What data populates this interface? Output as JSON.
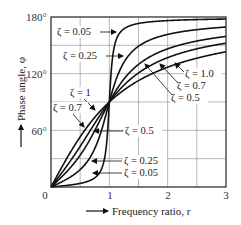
{
  "chart_data": {
    "type": "line",
    "title": "",
    "xlabel": "Frequency ratio, r",
    "ylabel": "Phase angle, φ",
    "xlim": [
      0,
      3
    ],
    "ylim": [
      0,
      180
    ],
    "x_ticks": [
      "0",
      "1",
      "2",
      "3"
    ],
    "y_ticks": [
      "60°",
      "120°",
      "180°"
    ],
    "grid": true,
    "grid_x_step": 0.5,
    "grid_y_step": 30,
    "formula": "phi = atan2(2*zeta*r, 1 - r^2)",
    "series": [
      {
        "name": "ζ = 0.05",
        "zeta": 0.05,
        "x": [
          0,
          0.5,
          0.9,
          1,
          1.1,
          1.5,
          2,
          3
        ],
        "values": [
          0,
          3.8,
          25.3,
          90,
          152.4,
          175.4,
          178.1,
          178.9
        ]
      },
      {
        "name": "ζ = 0.25",
        "zeta": 0.25,
        "x": [
          0,
          0.5,
          0.9,
          1,
          1.1,
          1.5,
          2,
          3
        ],
        "values": [
          0,
          18.4,
          67.0,
          90,
          110.5,
          148.0,
          161.6,
          169.4
        ]
      },
      {
        "name": "ζ = 0.5",
        "zeta": 0.5,
        "x": [
          0,
          0.5,
          0.9,
          1,
          1.1,
          1.5,
          2,
          3
        ],
        "values": [
          0,
          33.7,
          78.1,
          90,
          102.6,
          129.8,
          146.3,
          159.4
        ]
      },
      {
        "name": "ζ = 0.7",
        "zeta": 0.7,
        "x": [
          0,
          0.5,
          0.9,
          1,
          1.1,
          1.5,
          2,
          3
        ],
        "values": [
          0,
          43.0,
          81.5,
          90,
          97.7,
          120.3,
          136.8,
          152.3
        ]
      },
      {
        "name": "ζ = 1.0",
        "zeta": 1.0,
        "x": [
          0,
          0.5,
          0.9,
          1,
          1.1,
          1.5,
          2,
          3
        ],
        "values": [
          0,
          53.1,
          84.0,
          90,
          95.4,
          112.6,
          126.9,
          143.1
        ]
      }
    ],
    "annotations": [
      {
        "text": "ζ = 0.05",
        "pos": "upper-left, arrow to high branch"
      },
      {
        "text": "ζ = 0.25",
        "pos": "upper-left, arrow to high branch"
      },
      {
        "text": "ζ = 1.0",
        "pos": "right, arrow to high branch"
      },
      {
        "text": "ζ = 0.7",
        "pos": "right, arrow to high branch"
      },
      {
        "text": "ζ = 0.5",
        "pos": "right, arrow to high branch"
      },
      {
        "text": "ζ = 1",
        "pos": "left, arrow to low branch"
      },
      {
        "text": "ζ = 0.7",
        "pos": "left, arrow to low branch"
      },
      {
        "text": "ζ = 0.5",
        "pos": "center, arrow to low branch"
      },
      {
        "text": "ζ = 0.25",
        "pos": "lower center, arrow to low branch"
      },
      {
        "text": "ζ = 0.05",
        "pos": "lower center, arrow to low branch"
      }
    ]
  },
  "labels": {
    "y180": "180°",
    "y120": "120°",
    "y60": "60°",
    "x0": "0",
    "x1": "1",
    "x2": "2",
    "x3": "3",
    "xlabel": "Frequency ratio, r",
    "ylabel": "Phase angle, φ",
    "ann_hi_005": "ζ = 0.05",
    "ann_hi_025": "ζ = 0.25",
    "ann_hi_10": "ζ = 1.0",
    "ann_hi_07": "ζ = 0.7",
    "ann_hi_05": "ζ = 0.5",
    "ann_lo_1": "ζ = 1",
    "ann_lo_07": "ζ = 0.7",
    "ann_lo_05": "ζ = 0.5",
    "ann_lo_025": "ζ = 0.25",
    "ann_lo_005": "ζ = 0.05"
  }
}
